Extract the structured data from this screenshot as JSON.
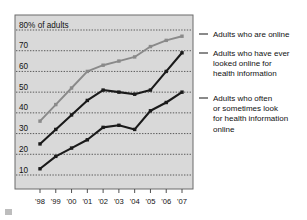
{
  "chart_data": {
    "type": "line",
    "title": "",
    "subtitle": "",
    "xlabel": "",
    "ylabel": "80% of adults",
    "ylabel_note": "80% of adults",
    "categories": [
      "'98",
      "'99",
      "'00",
      "'01",
      "'02",
      "'03",
      "'04",
      "'05",
      "'06",
      "'07"
    ],
    "x": [
      1998,
      1999,
      2000,
      2001,
      2002,
      2003,
      2004,
      2005,
      2006,
      2007
    ],
    "ylim": [
      0,
      80
    ],
    "xlim": [
      "'98",
      "'07"
    ],
    "yticks": [
      10,
      20,
      30,
      40,
      50,
      60,
      70,
      80
    ],
    "ytick_labels": [
      "10",
      "20",
      "30",
      "40",
      "50",
      "60",
      "70",
      "80% of adults"
    ],
    "grid": true,
    "grid_style": "dotted-horizontal",
    "legend_position": "right-outside",
    "series": [
      {
        "name": "Adults who are online",
        "color": "#8a8a8a",
        "values": [
          36,
          44,
          52,
          60,
          63,
          65,
          67,
          72,
          75,
          77
        ]
      },
      {
        "name": "Adults who have ever looked online for health information",
        "color": "#1a1a1a",
        "values": [
          25,
          32,
          39,
          46,
          51,
          50,
          49,
          51,
          60,
          69
        ]
      },
      {
        "name": "Adults who often or sometimes look for health information online",
        "color": "#1a1a1a",
        "values": [
          13,
          19,
          23,
          27,
          33,
          34,
          32,
          41,
          45,
          50
        ]
      }
    ]
  },
  "axis": {
    "y_top_label": "80% of adults",
    "y_labels": [
      "70",
      "60",
      "50",
      "40",
      "30",
      "20",
      "10"
    ],
    "x_labels": [
      "'98",
      "'99",
      "'00",
      "'01",
      "'02",
      "'03",
      "'04",
      "'05",
      "'06",
      "'07"
    ]
  },
  "legend": {
    "entries": [
      {
        "label": "Adults who are online",
        "lines": [
          "Adults who are online"
        ]
      },
      {
        "label": "Adults who have ever looked online for health information",
        "lines": [
          "Adults who have ever",
          "looked online for",
          "health information"
        ]
      },
      {
        "label": "Adults who often or sometimes look for health information online",
        "lines": [
          "Adults who often",
          "or sometimes look",
          "for health information",
          "online"
        ]
      }
    ]
  },
  "colors": {
    "plot_background": "#d9d9d9",
    "plot_border": "#6b6b6b",
    "page_background": "#ffffff",
    "series_online": "#8a8a8a",
    "series_ever_looked": "#1a1a1a",
    "series_often": "#1a1a1a",
    "gridline": "#4d4d4d",
    "text": "#111111"
  }
}
